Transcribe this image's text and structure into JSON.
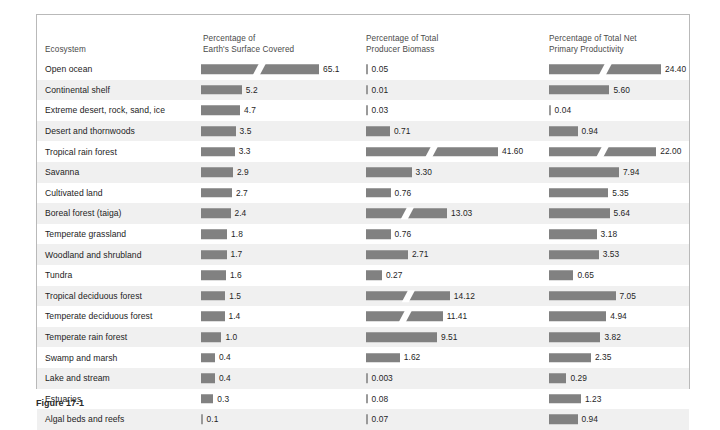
{
  "figure": {
    "caption_label": "Figure 17-1"
  },
  "columns": {
    "ecosystem": {
      "line1": "Ecosystem",
      "line2": ""
    },
    "surface": {
      "line1": "Percentage of",
      "line2": "Earth's Surface Covered"
    },
    "biomass": {
      "line1": "Percentage of Total",
      "line2": "Producer Biomass"
    },
    "npp": {
      "line1": "Percentage of Total Net",
      "line2": "Primary Productivity"
    }
  },
  "style": {
    "bar_color": "#818181",
    "stripe_color": "#f0f0f0",
    "border_color": "#b9b9b9"
  },
  "chart_data": {
    "type": "bar",
    "title": "",
    "xlabel": "",
    "ylabel": "Ecosystem",
    "categories": [
      "Open ocean",
      "Continental shelf",
      "Extreme desert, rock, sand, ice",
      "Desert and thornwoods",
      "Tropical rain forest",
      "Savanna",
      "Cultivated land",
      "Boreal forest (taiga)",
      "Temperate grassland",
      "Woodland and shrubland",
      "Tundra",
      "Tropical deciduous forest",
      "Temperate deciduous forest",
      "Temperate rain forest",
      "Swamp and marsh",
      "Lake and stream",
      "Estuaries",
      "Algal beds and reefs"
    ],
    "series": [
      {
        "name": "Percentage of Earth's Surface Covered",
        "labels": [
          "65.1",
          "5.2",
          "4.7",
          "3.5",
          "3.3",
          "2.9",
          "2.7",
          "2.4",
          "1.8",
          "1.7",
          "1.6",
          "1.5",
          "1.4",
          "1.0",
          "0.4",
          "0.4",
          "0.3",
          "0.1"
        ],
        "values": [
          65.1,
          5.2,
          4.7,
          3.5,
          3.3,
          2.9,
          2.7,
          2.4,
          1.8,
          1.7,
          1.6,
          1.5,
          1.4,
          1.0,
          0.4,
          0.4,
          0.3,
          0.1
        ],
        "broken": [
          true,
          false,
          false,
          false,
          false,
          false,
          false,
          false,
          false,
          false,
          false,
          false,
          false,
          false,
          false,
          false,
          false,
          false
        ]
      },
      {
        "name": "Percentage of Total Producer Biomass",
        "labels": [
          "0.05",
          "0.01",
          "0.03",
          "0.71",
          "41.60",
          "3.30",
          "0.76",
          "13.03",
          "0.76",
          "2.71",
          "0.27",
          "14.12",
          "11.41",
          "9.51",
          "1.62",
          "0.003",
          "0.08",
          "0.07"
        ],
        "values": [
          0.05,
          0.01,
          0.03,
          0.71,
          41.6,
          3.3,
          0.76,
          13.03,
          0.76,
          2.71,
          0.27,
          14.12,
          11.41,
          9.51,
          1.62,
          0.003,
          0.08,
          0.07
        ],
        "broken": [
          false,
          false,
          false,
          false,
          true,
          false,
          false,
          true,
          false,
          false,
          false,
          true,
          true,
          false,
          false,
          false,
          false,
          false
        ]
      },
      {
        "name": "Percentage of Total Net Primary Productivity",
        "labels": [
          "24.40",
          "5.60",
          "0.04",
          "0.94",
          "22.00",
          "7.94",
          "5.35",
          "5.64",
          "3.18",
          "3.53",
          "0.65",
          "7.05",
          "4.94",
          "3.82",
          "2.35",
          "0.29",
          "1.23",
          "0.94"
        ],
        "values": [
          24.4,
          5.6,
          0.04,
          0.94,
          22.0,
          7.94,
          5.35,
          5.64,
          3.18,
          3.53,
          0.65,
          7.05,
          4.94,
          3.82,
          2.35,
          0.29,
          1.23,
          0.94
        ],
        "broken": [
          true,
          false,
          false,
          false,
          true,
          false,
          false,
          false,
          false,
          false,
          false,
          false,
          false,
          false,
          false,
          false,
          false,
          false
        ]
      }
    ]
  }
}
